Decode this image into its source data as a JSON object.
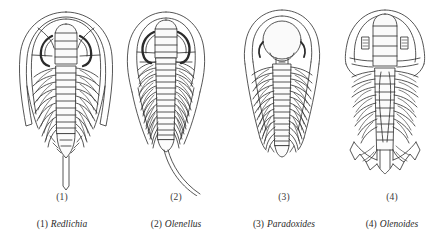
{
  "plate": {
    "subject": "cambrian-trilobite-genera",
    "background_color": "#ffffff",
    "ink_color": "#2b2b2b",
    "figure_count": 4
  },
  "figures": [
    {
      "number": "(1)",
      "genus": "Redlichia",
      "caption_index": "(1)",
      "caption_genus": "Redlichia",
      "center_x": 65,
      "traits": "broad semicircular cephalon, crescentic eye ridges, short axial tail spine"
    },
    {
      "number": "(2)",
      "genus": "Olenellus",
      "caption_index": "(2)",
      "caption_genus": "Olenellus",
      "center_x": 166,
      "traits": "crescentic eyes, long trailing caudal spine sweeping down to the right"
    },
    {
      "number": "(3)",
      "genus": "Paradoxides",
      "caption_index": "(3)",
      "caption_genus": "Paradoxides",
      "center_x": 282,
      "traits": "large bulbous rounded glabella, long genal spines, many thoracic segments"
    },
    {
      "number": "(4)",
      "genus": "Olenoides",
      "caption_index": "(4)",
      "caption_genus": "Olenoides",
      "center_x": 385,
      "traits": "elongate axis, small lateral eyes, scalloped spiny pygidial fringe"
    }
  ]
}
